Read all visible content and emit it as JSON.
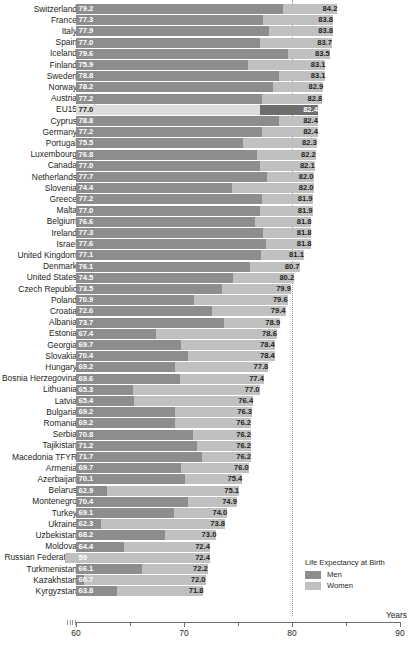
{
  "chart_data": {
    "type": "bar",
    "title": "",
    "subtitle": "",
    "xlabel": "Years",
    "ylabel": "",
    "xlim": [
      60,
      90
    ],
    "grid": false,
    "orientation": "horizontal",
    "stacked": true,
    "reference_line": 80,
    "axis_break_at_start": true,
    "legend": {
      "title": "Life Expectancy at Birth",
      "position": "bottom-right",
      "entries": [
        {
          "label": "Men",
          "color": "#8d8d8d",
          "swatch": "men"
        },
        {
          "label": "Women",
          "color": "#c0c0c0",
          "swatch": "women"
        }
      ]
    },
    "series": [
      {
        "name": "Men",
        "color": "#8d8d8d"
      },
      {
        "name": "Women",
        "color": "#c0c0c0"
      }
    ],
    "tick_labels": [
      "60",
      "70",
      "80",
      "90"
    ],
    "ticks": [
      60,
      70,
      80,
      90
    ],
    "categories": [
      "Switzerland",
      "France",
      "Italy",
      "Spain",
      "Iceland",
      "Finland",
      "Sweden",
      "Norway",
      "Austria",
      "EU15",
      "Cyprus",
      "Germany",
      "Portugal",
      "Luxembourg",
      "Canada",
      "Netherlands",
      "Slovenia",
      "Greece",
      "Malta",
      "Belgium",
      "Ireland",
      "Israel",
      "United Kingdom",
      "Denmark",
      "United States",
      "Czech Republic",
      "Poland",
      "Croatia",
      "Albania",
      "Estonia",
      "Georgia",
      "Slovakia",
      "Hungary",
      "Bosnia Herzegovina",
      "Lithuania",
      "Latvia",
      "Bulgaria",
      "Romania",
      "Serbia",
      "Tajikistan",
      "Macedonia TFYR",
      "Armenia",
      "Azerbaijan",
      "Belarus",
      "Montenegro",
      "Turkey",
      "Ukraine",
      "Uzbekistan",
      "Moldova",
      "Russian Federation",
      "Turkmenistan",
      "Kazakhstan",
      "Kyrgyzstan"
    ],
    "men": [
      79.2,
      77.3,
      77.9,
      77.0,
      79.6,
      75.9,
      78.8,
      78.2,
      77.2,
      77.0,
      78.8,
      77.2,
      75.5,
      76.8,
      77.0,
      77.7,
      74.4,
      77.2,
      77.0,
      76.6,
      77.3,
      77.6,
      77.1,
      76.1,
      74.5,
      73.5,
      70.9,
      72.6,
      73.7,
      67.4,
      69.7,
      70.4,
      69.2,
      69.6,
      65.3,
      65.4,
      69.2,
      69.2,
      70.8,
      71.2,
      71.7,
      69.7,
      70.1,
      62.9,
      70.4,
      69.1,
      62.3,
      68.2,
      64.4,
      59.0,
      66.1,
      60.7,
      63.8
    ],
    "total": [
      84.2,
      83.8,
      83.8,
      83.7,
      83.5,
      83.1,
      83.1,
      82.9,
      82.8,
      82.4,
      82.4,
      82.4,
      82.3,
      82.2,
      82.1,
      82.0,
      82.0,
      81.9,
      81.9,
      81.8,
      81.8,
      81.8,
      81.1,
      80.7,
      80.2,
      79.9,
      79.6,
      79.4,
      78.9,
      78.6,
      78.4,
      78.4,
      77.8,
      77.4,
      77.0,
      76.4,
      76.3,
      76.2,
      76.2,
      76.2,
      76.2,
      76.0,
      75.4,
      75.1,
      74.9,
      74.0,
      73.8,
      73.0,
      72.4,
      72.4,
      72.2,
      72.0,
      71.8
    ],
    "men_labels": [
      "79.2",
      "77.3",
      "77.9",
      "77.0",
      "79.6",
      "75.9",
      "78.8",
      "78.2",
      "77.2",
      "77.0",
      "78.8",
      "77.2",
      "75.5",
      "76.8",
      "77.0",
      "77.7",
      "74.4",
      "77.2",
      "77.0",
      "76.6",
      "77.3",
      "77.6",
      "77.1",
      "76.1",
      "74.5",
      "73.5",
      "70.9",
      "72.6",
      "73.7",
      "67.4",
      "69.7",
      "70.4",
      "69.2",
      "69.6",
      "65.3",
      "65.4",
      "69.2",
      "69.2",
      "70.8",
      "71.2",
      "71.7",
      "69.7",
      "70.1",
      "62.9",
      "70.4",
      "69.1",
      "62.3",
      "68.2",
      "64.4",
      "59",
      "66.1",
      "60.7",
      "63.8"
    ],
    "total_labels": [
      "84.2",
      "83.8",
      "83.8",
      "83.7",
      "83.5",
      "83.1",
      "83.1",
      "82.9",
      "82.8",
      "82.4",
      "82.4",
      "82.4",
      "82.3",
      "82.2",
      "82.1",
      "82.0",
      "82.0",
      "81.9",
      "81.9",
      "81.8",
      "81.8",
      "81.8",
      "81.1",
      "80.7",
      "80.2",
      "79.9",
      "79.6",
      "79.4",
      "78.9",
      "78.6",
      "78.4",
      "78.4",
      "77.8",
      "77.4",
      "77.0",
      "76.4",
      "76.3",
      "76.2",
      "76.2",
      "76.2",
      "76.2",
      "76.0",
      "75.4",
      "75.1",
      "74.9",
      "74.0",
      "73.8",
      "73.0",
      "72.4",
      "72.4",
      "72.2",
      "72.0",
      "71.8"
    ],
    "highlighted_category": "EU15"
  }
}
